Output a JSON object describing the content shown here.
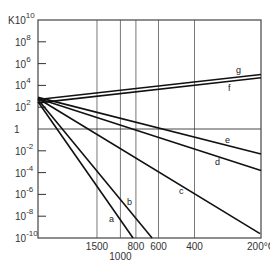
{
  "chart_data": {
    "type": "line",
    "title": "",
    "ylabel": "K",
    "xlabel": "°C",
    "y_scale": "log",
    "x_scale": "reciprocal temperature (1/T)",
    "ylim_log10": [
      -10,
      10
    ],
    "y_ticks": [
      {
        "exp": "10",
        "base": "K10",
        "log": 10
      },
      {
        "exp": "8",
        "base": "10",
        "log": 8
      },
      {
        "exp": "6",
        "base": "10",
        "log": 6
      },
      {
        "exp": "4",
        "base": "10",
        "log": 4
      },
      {
        "exp": "2",
        "base": "10",
        "log": 2
      },
      {
        "exp": "",
        "base": "1",
        "log": 0
      },
      {
        "exp": "-2",
        "base": "10",
        "log": -2
      },
      {
        "exp": "-4",
        "base": "10",
        "log": -4
      },
      {
        "exp": "-6",
        "base": "10",
        "log": -6
      },
      {
        "exp": "-8",
        "base": "10",
        "log": -8
      },
      {
        "exp": "-10",
        "base": "10",
        "log": -10
      }
    ],
    "x_ticks": [
      {
        "label": "1500",
        "temp_c": 1500,
        "row": 0
      },
      {
        "label": "1000",
        "temp_c": 1000,
        "row": 1
      },
      {
        "label": "800",
        "temp_c": 800,
        "row": 0
      },
      {
        "label": "600",
        "temp_c": 600,
        "row": 0
      },
      {
        "label": "400",
        "temp_c": 400,
        "row": 0
      },
      {
        "label": "200°C",
        "temp_c": 200,
        "row": 0
      }
    ],
    "grid": {
      "vertical_at_ticks": true,
      "horizontal_at": [
        0
      ]
    },
    "series": [
      {
        "name": "a",
        "points": [
          {
            "invT": 0.0,
            "logK": 2.5
          },
          {
            "invT": 0.905,
            "logK": -10
          }
        ]
      },
      {
        "name": "b",
        "points": [
          {
            "invT": 0.0,
            "logK": 2.7
          },
          {
            "invT": 1.085,
            "logK": -10
          }
        ]
      },
      {
        "name": "c",
        "points": [
          {
            "invT": 0.0,
            "logK": 2.8
          },
          {
            "invT": 2.105,
            "logK": -9.6
          }
        ]
      },
      {
        "name": "d",
        "points": [
          {
            "invT": 0.0,
            "logK": 2.8
          },
          {
            "invT": 2.114,
            "logK": -3.8
          }
        ]
      },
      {
        "name": "e",
        "points": [
          {
            "invT": 0.0,
            "logK": 2.9
          },
          {
            "invT": 2.114,
            "logK": -2.3
          }
        ]
      },
      {
        "name": "f",
        "points": [
          {
            "invT": 0.0,
            "logK": 2.4
          },
          {
            "invT": 2.114,
            "logK": 4.7
          }
        ]
      },
      {
        "name": "g",
        "points": [
          {
            "invT": 0.0,
            "logK": 2.7
          },
          {
            "invT": 2.114,
            "logK": 5.0
          }
        ]
      }
    ],
    "series_labels": [
      {
        "name": "a",
        "x": 109,
        "y": 222
      },
      {
        "name": "b",
        "x": 127,
        "y": 205
      },
      {
        "name": "c",
        "x": 179,
        "y": 194
      },
      {
        "name": "d",
        "x": 215,
        "y": 165
      },
      {
        "name": "e",
        "x": 225,
        "y": 143
      },
      {
        "name": "f",
        "x": 228,
        "y": 91
      },
      {
        "name": "g",
        "x": 236,
        "y": 73
      }
    ]
  }
}
